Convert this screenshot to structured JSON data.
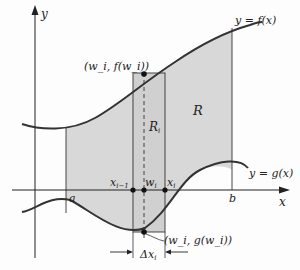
{
  "diagram": {
    "axes": {
      "x_label": "x",
      "y_label": "y"
    },
    "curves": {
      "f_label": "y = f(x)",
      "g_label": "y = g(x)"
    },
    "points": {
      "a": "a",
      "b": "b",
      "x_prev": "x",
      "x_prev_sub": "i−1",
      "w": "w",
      "w_sub": "i",
      "x_i": "x",
      "x_i_sub": "i"
    },
    "regions": {
      "R": "R",
      "R_i": "R",
      "R_i_sub": "i"
    },
    "annotations": {
      "top_point": "(w_i, f(w_i))",
      "bottom_point": "(w_i, g(w_i))",
      "delta": "Δx",
      "delta_sub": "i"
    },
    "colors": {
      "shade": "#d8d8d8",
      "curve": "#333333",
      "axis": "#222222"
    }
  }
}
